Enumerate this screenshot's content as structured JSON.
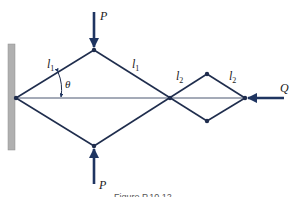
{
  "diagram": {
    "colors": {
      "member": "#1f2d4d",
      "arrow": "#1f3561",
      "wall": "#a9a9a9",
      "wall_edge": "#8a8a8a",
      "axis": "#4a5670"
    },
    "labels": {
      "P_top": "P",
      "P_bottom": "P",
      "Q": "Q",
      "l1_left": "l",
      "l1_left_sub": "1",
      "l1_right": "l",
      "l1_right_sub": "1",
      "l2_left": "l",
      "l2_left_sub": "2",
      "l2_right": "l",
      "l2_right_sub": "2",
      "theta": "θ"
    },
    "caption": "Figure P.10.12",
    "nodes": {
      "support": [
        16,
        98
      ],
      "top": [
        94,
        50
      ],
      "bottom": [
        94,
        146
      ],
      "cross": [
        170,
        98
      ],
      "small_top": [
        207,
        74
      ],
      "small_bottom": [
        207,
        121
      ],
      "right": [
        245,
        98
      ]
    }
  }
}
